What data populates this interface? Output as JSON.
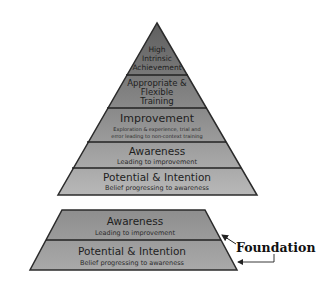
{
  "pyramid": {
    "layers": [
      {
        "title_lines": [
          "High",
          "Intrinsic",
          "Achievement"
        ],
        "subtitle_lines": []
      },
      {
        "title_lines": [
          "Appropriate &",
          "Flexible",
          "Training"
        ],
        "subtitle_lines": []
      },
      {
        "title_lines": [
          "Improvement"
        ],
        "subtitle_lines": [
          "Exploration & experience, trial and",
          "error leading to non-context training"
        ]
      },
      {
        "title_lines": [
          "Awareness"
        ],
        "subtitle_lines": [
          "Leading to improvement"
        ]
      },
      {
        "title_lines": [
          "Potential & Intention"
        ],
        "subtitle_lines": [
          "Belief progressing to awareness"
        ]
      }
    ]
  },
  "foundation": {
    "label": "Foundation",
    "layers": [
      {
        "title": "Awareness",
        "subtitle": "Leading to improvement"
      },
      {
        "title": "Potential & Intention",
        "subtitle": "Belief progressing to awareness"
      }
    ]
  },
  "colors": {
    "layer_top": "#6e6e6e",
    "layer_mid": "#8a8a8a",
    "layer_bottom": "#b4b4b4",
    "outline": "#2b2b2b"
  }
}
